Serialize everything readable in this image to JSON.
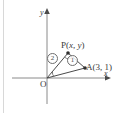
{
  "figure": {
    "type": "coordinate-geometry-diagram",
    "background_color": "#ffffff",
    "stroke_color": "#4a4a4a",
    "axes": {
      "x_axis_label": "x",
      "y_axis_label": "y",
      "origin_label": "O",
      "x_axis_has_arrow": true,
      "y_axis_has_arrow": true
    },
    "points": [
      {
        "name": "O",
        "label": "O",
        "x": 0,
        "y": 0
      },
      {
        "name": "P",
        "label": "P (x, y)",
        "label_parts": {
          "name": "P",
          "open": "(",
          "x": "x",
          "comma": ", ",
          "y": "y",
          "close": ")"
        }
      },
      {
        "name": "A",
        "label": "A(3, 1)",
        "label_parts": {
          "name": "A",
          "open": "(",
          "x": "3",
          "comma": ", ",
          "y": "1",
          "close": ")"
        },
        "x": 3,
        "y": 1
      }
    ],
    "segments": [
      {
        "from": "O",
        "to": "P"
      },
      {
        "from": "O",
        "to": "A"
      },
      {
        "from": "P",
        "to": "A"
      }
    ],
    "angle_markers": [
      {
        "id": "marker-2",
        "label": "2",
        "at_vertex": "O"
      },
      {
        "id": "marker-1",
        "label": "1",
        "at_vertex": "P"
      }
    ]
  }
}
